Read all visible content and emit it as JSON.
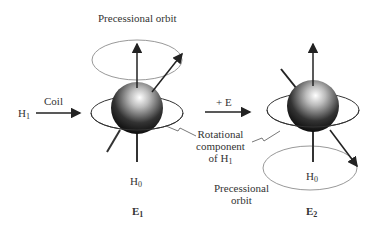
{
  "diagram": {
    "labels": {
      "precessional_orbit_top": "Precessional orbit",
      "coil": "Coil",
      "h1": "H",
      "h1_sub": "1",
      "plus_e": "+ E",
      "rotational_line1": "Rotational",
      "rotational_line2": "component",
      "rotational_line3": "of H",
      "rotational_sub": "1",
      "h0_left": "H",
      "h0_left_sub": "0",
      "h0_right": "H",
      "h0_right_sub": "0",
      "precessional_orbit_bottom_line1": "Precessional",
      "precessional_orbit_bottom_line2": "orbit",
      "e1": "E",
      "e1_sub": "1",
      "e2": "E",
      "e2_sub": "2"
    },
    "states": [
      {
        "name": "E1",
        "spin": "aligned with H0, precessing on upper orbit"
      },
      {
        "name": "E2",
        "spin": "flipped against H0, precessing on lower orbit"
      }
    ],
    "colors": {
      "orbit": "#888888",
      "ring": "#333333",
      "arrow": "#222222"
    }
  }
}
